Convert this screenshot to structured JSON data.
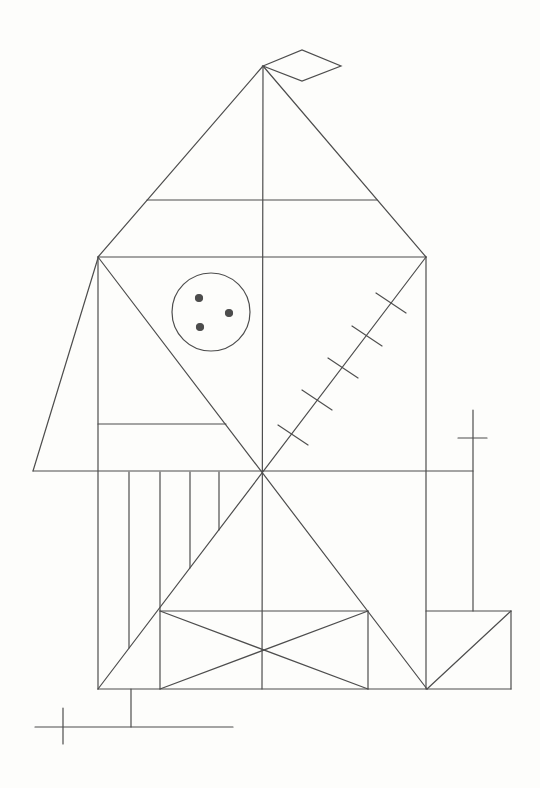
{
  "figure": {
    "kind": "line-drawing",
    "canvas": {
      "width": 540,
      "height": 788,
      "background": "#fdfdfb"
    },
    "stroke": {
      "color": "#4d4d4d",
      "width": 1.2
    },
    "lines": [
      {
        "name": "roof-left-edge",
        "x1": 263,
        "y1": 66,
        "x2": 98,
        "y2": 257
      },
      {
        "name": "roof-right-edge",
        "x1": 263,
        "y1": 66,
        "x2": 426,
        "y2": 257
      },
      {
        "name": "roof-band-line",
        "x1": 147,
        "y1": 200,
        "x2": 377,
        "y2": 200
      },
      {
        "name": "vertical-midline",
        "x1": 263,
        "y1": 66,
        "x2": 262,
        "y2": 689
      },
      {
        "name": "rect-top-edge",
        "x1": 98,
        "y1": 257,
        "x2": 426,
        "y2": 257
      },
      {
        "name": "rect-left-edge",
        "x1": 98,
        "y1": 257,
        "x2": 98,
        "y2": 689
      },
      {
        "name": "rect-right-edge",
        "x1": 426,
        "y1": 257,
        "x2": 426,
        "y2": 689
      },
      {
        "name": "rect-bottom-edge",
        "x1": 98,
        "y1": 689,
        "x2": 511,
        "y2": 689
      },
      {
        "name": "horizontal-midline",
        "x1": 33,
        "y1": 471,
        "x2": 473,
        "y2": 471
      },
      {
        "name": "diagonal-tr-to-bl",
        "x1": 426,
        "y1": 257,
        "x2": 98,
        "y2": 689
      },
      {
        "name": "diagonal-tl-to-br",
        "x1": 98,
        "y1": 257,
        "x2": 427,
        "y2": 689
      },
      {
        "name": "left-flap-edge",
        "x1": 98,
        "y1": 258,
        "x2": 33,
        "y2": 471
      },
      {
        "name": "left-short-bar",
        "x1": 98,
        "y1": 424,
        "x2": 226,
        "y2": 424
      },
      {
        "name": "stripe-1",
        "x1": 129,
        "y1": 472,
        "x2": 129,
        "y2": 648
      },
      {
        "name": "stripe-2",
        "x1": 160,
        "y1": 472,
        "x2": 160,
        "y2": 689
      },
      {
        "name": "stripe-3",
        "x1": 190,
        "y1": 472,
        "x2": 190,
        "y2": 568
      },
      {
        "name": "stripe-4",
        "x1": 219,
        "y1": 472,
        "x2": 219,
        "y2": 530
      },
      {
        "name": "base-rect-top-edge",
        "x1": 160,
        "y1": 611,
        "x2": 368,
        "y2": 611
      },
      {
        "name": "base-rect-right-edge",
        "x1": 368,
        "y1": 611,
        "x2": 368,
        "y2": 689
      },
      {
        "name": "base-x-diagonal-1",
        "x1": 160,
        "y1": 611,
        "x2": 368,
        "y2": 689
      },
      {
        "name": "base-x-diagonal-2",
        "x1": 160,
        "y1": 689,
        "x2": 368,
        "y2": 611
      },
      {
        "name": "right-block-top-edge",
        "x1": 426,
        "y1": 611,
        "x2": 511,
        "y2": 611
      },
      {
        "name": "right-block-right-edge",
        "x1": 511,
        "y1": 611,
        "x2": 511,
        "y2": 689
      },
      {
        "name": "right-block-diagonal",
        "x1": 427,
        "y1": 689,
        "x2": 511,
        "y2": 611
      },
      {
        "name": "right-cross-stem",
        "x1": 473,
        "y1": 410,
        "x2": 473,
        "y2": 611
      },
      {
        "name": "right-cross-bar",
        "x1": 458,
        "y1": 438,
        "x2": 487,
        "y2": 438
      },
      {
        "name": "bottom-cross-stem",
        "x1": 131,
        "y1": 689,
        "x2": 131,
        "y2": 727
      },
      {
        "name": "bottom-cross-bar",
        "x1": 35,
        "y1": 727,
        "x2": 233,
        "y2": 727
      },
      {
        "name": "bottom-cross-tick",
        "x1": 63,
        "y1": 708,
        "x2": 63,
        "y2": 744
      }
    ],
    "polygons": [
      {
        "name": "flag-diamond",
        "points": [
          [
            263,
            66
          ],
          [
            302,
            50
          ],
          [
            341,
            66
          ],
          [
            302,
            81
          ]
        ]
      }
    ],
    "circle": {
      "name": "dotted-circle",
      "cx": 211,
      "cy": 312,
      "r": 39,
      "dot_r": 3.5,
      "dots": [
        [
          199,
          298
        ],
        [
          229,
          313
        ],
        [
          200,
          327
        ]
      ]
    },
    "hatch_ticks": {
      "name": "hatch-tick",
      "dx": 15,
      "dy": 10,
      "centers": [
        [
          293,
          435
        ],
        [
          317,
          400
        ],
        [
          343,
          368
        ],
        [
          367,
          336
        ],
        [
          391,
          303
        ]
      ]
    }
  }
}
